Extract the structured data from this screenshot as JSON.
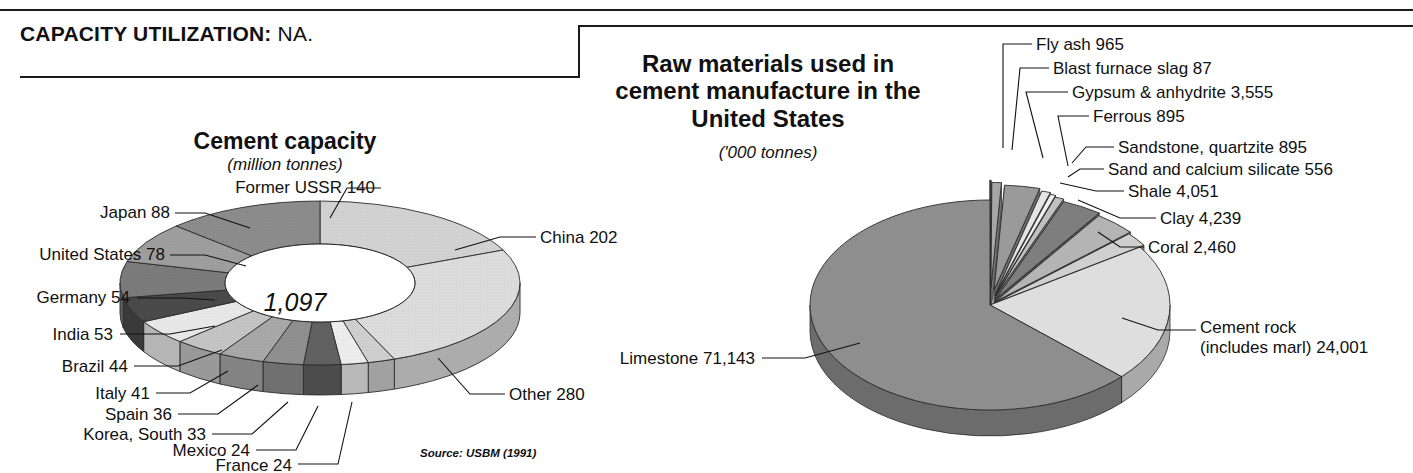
{
  "header": {
    "capacity_label": "CAPACITY UTILIZATION:",
    "capacity_value": "NA."
  },
  "source_note": "Source: USBM (1991)",
  "chart_data": [
    {
      "type": "pie",
      "variant": "doughnut-3d",
      "title": "Cement capacity",
      "subtitle": "(million tonnes)",
      "center_label": "1,097",
      "total": 1097,
      "unit": "million tonnes",
      "legend": "callout-labels",
      "categories": [
        "China",
        "Former USSR",
        "Japan",
        "United States",
        "Germany",
        "India",
        "Brazil",
        "Italy",
        "Spain",
        "Korea, South",
        "Mexico",
        "France",
        "Other"
      ],
      "values": [
        202,
        140,
        88,
        78,
        54,
        53,
        44,
        41,
        36,
        33,
        24,
        24,
        280
      ],
      "labels": [
        "China 202",
        "Former USSR 140",
        "Japan 88",
        "United States 78",
        "Germany 54",
        "India 53",
        "Brazil 44",
        "Italy 41",
        "Spain 36",
        "Korea, South 33",
        "Mexico 24",
        "France 24",
        "Other 280"
      ],
      "colors": [
        "#d2d2d2",
        "#8c8c8c",
        "#9e9e9e",
        "#7b7b7b",
        "#4a4a4a",
        "#e8e8e8",
        "#c4c4c4",
        "#a8a8a8",
        "#8f8f8f",
        "#616161",
        "#ededed",
        "#cfcfcf",
        "#dcdcdc"
      ]
    },
    {
      "type": "pie",
      "variant": "exploded-3d",
      "title": "Raw materials used in cement manufacture in the United States",
      "subtitle": "('000 tonnes)",
      "unit": "'000 tonnes",
      "legend": "callout-labels",
      "categories": [
        "Limestone",
        "Cement rock (includes marl)",
        "Clay",
        "Shale",
        "Coral",
        "Gypsum & anhydrite",
        "Fly ash",
        "Sandstone, quartzite",
        "Ferrous",
        "Sand and calcium silicate",
        "Blast furnace slag"
      ],
      "values": [
        71143,
        24001,
        4239,
        4051,
        2460,
        3555,
        965,
        895,
        895,
        556,
        87
      ],
      "labels": [
        "Limestone 71,143",
        "Cement rock",
        "(includes marl) 24,001",
        "Clay 4,239",
        "Shale 4,051",
        "Coral 2,460",
        "Gypsum & anhydrite 3,555",
        "Fly ash 965",
        "Sandstone, quartzite 895",
        "Ferrous 895",
        "Sand and calcium silicate 556",
        "Blast furnace slag 87"
      ],
      "colors": [
        "#8e8e8e",
        "#dedede",
        "#b4b4b4",
        "#7e7e7e",
        "#cfcfcf",
        "#9a9a9a",
        "#a6a6a6",
        "#c0c0c0",
        "#e4e4e4",
        "#efefef",
        "#888888"
      ]
    }
  ]
}
